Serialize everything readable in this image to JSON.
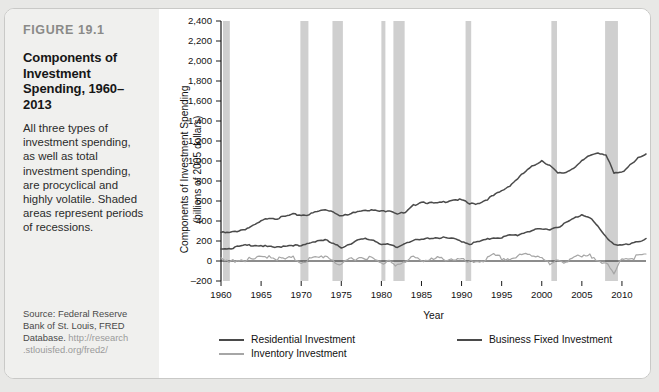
{
  "figure": {
    "number": "FIGURE 19.1",
    "title": "Components of Investment Spending, 1960–2013",
    "description": "All three types of investment spending, as well as total investment spending, are procyclical and highly volatile. Shaded areas represent periods of recessions.",
    "source_line1": "Source: Federal Reserve",
    "source_line2": "Bank of St. Louis, FRED",
    "source_line3_prefix": "Database. ",
    "source_url_line1": "http://research",
    "source_url_line2": ".stlouisfed.org/fred2/"
  },
  "colors": {
    "panel_background": "#f0f0ee",
    "card_background": "#ffffff",
    "page_background": "#e8e8e6",
    "recession_band": "#cfcfcf",
    "residential": "#4a4a4a",
    "business_fixed": "#4a4a4a",
    "inventory": "#a6a6a6",
    "axis": "#1a1a1a",
    "figure_number": "#8a8a88"
  },
  "chart_data": {
    "type": "line",
    "title": "Components of Investment Spending, 1960–2013",
    "xlabel": "Year",
    "ylabel": "Components of Investment Spending (billions of 2005 dollars)",
    "ylabel_line1": "Components of Investment Spending",
    "ylabel_line2": "(billions of 2005 dollars)",
    "xlim": [
      1960,
      2013
    ],
    "ylim": [
      -200,
      2400
    ],
    "ytick_step": 200,
    "grid": false,
    "legend_position": "bottom",
    "xticks": [
      1960,
      1965,
      1970,
      1975,
      1980,
      1985,
      1990,
      1995,
      2000,
      2005,
      2010
    ],
    "yticks": [
      -200,
      0,
      200,
      400,
      600,
      800,
      1000,
      1200,
      1400,
      1600,
      1800,
      2000,
      2200,
      2400
    ],
    "ytick_labels": [
      "–200",
      "0",
      "200",
      "400",
      "600",
      "800",
      "1,000",
      "1,200",
      "1,400",
      "1,600",
      "1,800",
      "2,000",
      "2,200",
      "2,400"
    ],
    "recessions": [
      {
        "start": 1960.25,
        "end": 1961.1
      },
      {
        "start": 1969.9,
        "end": 1970.9
      },
      {
        "start": 1973.9,
        "end": 1975.2
      },
      {
        "start": 1980.0,
        "end": 1980.5
      },
      {
        "start": 1981.5,
        "end": 1982.9
      },
      {
        "start": 1990.5,
        "end": 1991.2
      },
      {
        "start": 2001.2,
        "end": 2001.9
      },
      {
        "start": 2007.9,
        "end": 2009.5
      }
    ],
    "x": [
      1960,
      1961,
      1962,
      1963,
      1964,
      1965,
      1966,
      1967,
      1968,
      1969,
      1970,
      1971,
      1972,
      1973,
      1974,
      1975,
      1976,
      1977,
      1978,
      1979,
      1980,
      1981,
      1982,
      1983,
      1984,
      1985,
      1986,
      1987,
      1988,
      1989,
      1990,
      1991,
      1992,
      1993,
      1994,
      1995,
      1996,
      1997,
      1998,
      1999,
      2000,
      2001,
      2002,
      2003,
      2004,
      2005,
      2006,
      2007,
      2008,
      2009,
      2010,
      2011,
      2012,
      2013
    ],
    "series": [
      {
        "name": "Business Fixed Investment",
        "color": "#4a4a4a",
        "values": [
          290,
          285,
          305,
          325,
          355,
          400,
          440,
          430,
          450,
          470,
          465,
          470,
          500,
          520,
          500,
          455,
          470,
          505,
          520,
          510,
          500,
          515,
          480,
          485,
          560,
          600,
          585,
          580,
          600,
          620,
          615,
          575,
          580,
          615,
          660,
          705,
          760,
          830,
          900,
          960,
          1010,
          960,
          880,
          890,
          940,
          1000,
          1060,
          1090,
          1070,
          880,
          890,
          970,
          1030,
          1070
        ]
      },
      {
        "name": "Residential Investment",
        "color": "#4a4a4a",
        "values": [
          135,
          130,
          145,
          160,
          165,
          160,
          145,
          140,
          160,
          165,
          150,
          185,
          210,
          215,
          175,
          140,
          175,
          210,
          225,
          215,
          175,
          165,
          140,
          190,
          210,
          215,
          235,
          240,
          235,
          225,
          205,
          175,
          195,
          215,
          240,
          240,
          260,
          265,
          295,
          315,
          320,
          325,
          345,
          385,
          430,
          470,
          445,
          345,
          245,
          175,
          165,
          170,
          200,
          225
        ]
      },
      {
        "name": "Inventory Investment",
        "color": "#a6a6a6",
        "values": [
          20,
          -5,
          30,
          25,
          25,
          45,
          70,
          35,
          30,
          40,
          5,
          30,
          40,
          70,
          25,
          -45,
          35,
          45,
          55,
          30,
          -20,
          35,
          -30,
          -15,
          70,
          25,
          15,
          35,
          35,
          35,
          20,
          -10,
          15,
          25,
          65,
          40,
          35,
          55,
          75,
          70,
          65,
          -30,
          10,
          15,
          55,
          45,
          60,
          40,
          -15,
          -130,
          55,
          40,
          60,
          70
        ]
      }
    ],
    "legend": [
      {
        "label": "Residential Investment",
        "color": "#4a4a4a",
        "column": 1,
        "row": 1
      },
      {
        "label": "Business Fixed Investment",
        "color": "#4a4a4a",
        "column": 2,
        "row": 1
      },
      {
        "label": "Inventory Investment",
        "color": "#a6a6a6",
        "column": 1,
        "row": 2
      }
    ]
  }
}
